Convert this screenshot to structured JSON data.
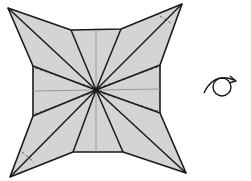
{
  "diagram": {
    "title": "",
    "colors": {
      "paper_fill": "#d4d4d4",
      "edge": "#1a1a1a",
      "crease": "#8c8c8c",
      "background": "#ffffff"
    },
    "center": [
      96,
      90
    ],
    "outline": [
      [
        8,
        8
      ],
      [
        71,
        30
      ],
      [
        121,
        29
      ],
      [
        182,
        4
      ],
      [
        160,
        65
      ],
      [
        160,
        113
      ],
      [
        186,
        173
      ],
      [
        123,
        152
      ],
      [
        73,
        152
      ],
      [
        10,
        177
      ],
      [
        33,
        116
      ],
      [
        33,
        66
      ]
    ],
    "rays_to": [
      [
        8,
        8
      ],
      [
        71,
        30
      ],
      [
        121,
        29
      ],
      [
        182,
        4
      ],
      [
        160,
        65
      ],
      [
        160,
        113
      ],
      [
        186,
        173
      ],
      [
        123,
        152
      ],
      [
        73,
        152
      ],
      [
        10,
        177
      ],
      [
        33,
        116
      ],
      [
        33,
        66
      ]
    ],
    "center_creases": [
      [
        [
          96,
          30
        ],
        [
          96,
          152
        ]
      ],
      [
        [
          33,
          91
        ],
        [
          160,
          89
        ]
      ]
    ],
    "dashed_lines": [
      [
        [
          35,
          68
        ],
        [
          94,
          88
        ]
      ],
      [
        [
          35,
          114
        ],
        [
          94,
          92
        ]
      ],
      [
        [
          158,
          67
        ],
        [
          98,
          88
        ]
      ],
      [
        [
          158,
          111
        ],
        [
          98,
          92
        ]
      ],
      [
        [
          160,
          16
        ],
        [
          172,
          24
        ]
      ],
      [
        [
          22,
          152
        ],
        [
          34,
          162
        ]
      ]
    ],
    "symbol": {
      "name": "turn-over",
      "label": "Turn over"
    }
  }
}
